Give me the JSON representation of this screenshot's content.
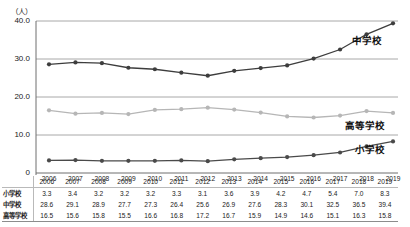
{
  "chart_data": {
    "type": "line",
    "title": "",
    "xlabel": "",
    "ylabel": "(人)",
    "ylim": [
      0,
      40
    ],
    "yticks": [
      "0",
      "10.0",
      "20.0",
      "30.0",
      "40.0"
    ],
    "grid": true,
    "legend_position": "right-inline",
    "categories": [
      "2006",
      "2007",
      "2008",
      "2009",
      "2010",
      "2011",
      "2012",
      "2013",
      "2014",
      "2015",
      "2016",
      "2017",
      "2018",
      "2019"
    ],
    "series": [
      {
        "name": "小学校",
        "color": "#4a4a4a",
        "values": [
          3.3,
          3.4,
          3.2,
          3.2,
          3.2,
          3.3,
          3.1,
          3.6,
          3.9,
          4.2,
          4.7,
          5.4,
          7.0,
          8.3
        ]
      },
      {
        "name": "中学校",
        "color": "#3d3d3d",
        "values": [
          28.6,
          29.1,
          28.9,
          27.7,
          27.3,
          26.4,
          25.6,
          26.9,
          27.6,
          28.3,
          30.1,
          32.5,
          36.5,
          39.4
        ]
      },
      {
        "name": "高等学校",
        "color": "#b6b6b6",
        "values": [
          16.5,
          15.6,
          15.8,
          15.5,
          16.6,
          16.8,
          17.2,
          16.7,
          15.9,
          14.9,
          14.6,
          15.1,
          16.3,
          15.8
        ]
      }
    ]
  },
  "axis": {
    "unit": "（人）",
    "yticks": [
      "40.0",
      "30.0",
      "20.0",
      "10.0",
      "0"
    ]
  },
  "series_labels": {
    "chugakko": "中学校",
    "kotogakko": "高等学校",
    "shogakko": "小学校"
  },
  "table": {
    "corner": "",
    "columns": [
      "2006",
      "2007",
      "2008",
      "2009",
      "2010",
      "2011",
      "2012",
      "2013",
      "2014",
      "2015",
      "2016",
      "2017",
      "2018",
      "2019"
    ],
    "rows": [
      {
        "label": "小学校",
        "values": [
          "3.3",
          "3.4",
          "3.2",
          "3.2",
          "3.2",
          "3.3",
          "3.1",
          "3.6",
          "3.9",
          "4.2",
          "4.7",
          "5.4",
          "7.0",
          "8.3"
        ]
      },
      {
        "label": "中学校",
        "values": [
          "28.6",
          "29.1",
          "28.9",
          "27.7",
          "27.3",
          "26.4",
          "25.6",
          "26.9",
          "27.6",
          "28.3",
          "30.1",
          "32.5",
          "36.5",
          "39.4"
        ]
      },
      {
        "label": "高等学校",
        "values": [
          "16.5",
          "15.6",
          "15.8",
          "15.5",
          "16.6",
          "16.8",
          "17.2",
          "16.7",
          "15.9",
          "14.9",
          "14.6",
          "15.1",
          "16.3",
          "15.8"
        ]
      }
    ]
  },
  "colors": {
    "grid": "#a8a8a8",
    "axis": "#6f6f6f",
    "dark_series": "#3d3d3d",
    "light_series": "#b6b6b6"
  }
}
